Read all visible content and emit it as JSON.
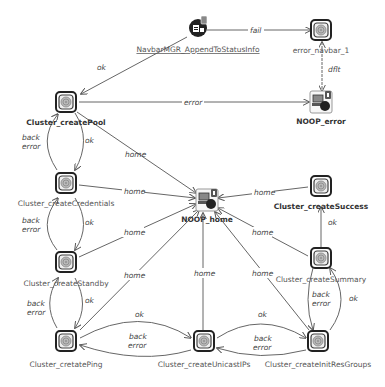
{
  "diagram": {
    "type": "state-flow",
    "nodes": {
      "navbar": {
        "label": "NavbarMGR_AppendToStatusInfo",
        "kind": "action-node"
      },
      "error_navbar": {
        "label": "error_navbar_1",
        "kind": "state"
      },
      "noop_error": {
        "label": "NOOP_error",
        "kind": "noop-terminal"
      },
      "create_pool": {
        "label": "Cluster_createPool",
        "kind": "state"
      },
      "noop_home": {
        "label": "NOOP_home",
        "kind": "noop-terminal"
      },
      "create_credentials": {
        "label": "Cluster_createCredentials",
        "kind": "state"
      },
      "create_success": {
        "label": "Cluster_createSuccess",
        "kind": "state"
      },
      "create_standby": {
        "label": "Cluster_createStandby",
        "kind": "state"
      },
      "create_summary": {
        "label": "Cluster_createSummary",
        "kind": "state"
      },
      "create_ping": {
        "label": "Cluster_cretatePing",
        "kind": "state"
      },
      "create_unicast": {
        "label": "Cluster_createUnicastIPs",
        "kind": "state"
      },
      "create_initres": {
        "label": "Cluster_createInitResGroups",
        "kind": "state"
      }
    },
    "edge_labels": {
      "fail": "fail",
      "dflt": "dflt",
      "ok": "ok",
      "error": "error",
      "home": "home",
      "back": "back",
      "back_error": "error"
    }
  }
}
